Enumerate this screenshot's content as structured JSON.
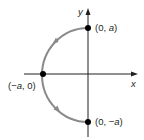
{
  "figure": {
    "type": "parametric-curve-diagram",
    "axes": {
      "x_label": "x",
      "y_label": "y"
    },
    "points": [
      {
        "id": "top",
        "label_text": "(0, a)",
        "label_pre": "(0, ",
        "label_var": "a",
        "label_post": ")"
      },
      {
        "id": "left",
        "label_text": "(−a, 0)",
        "label_pre": "(−",
        "label_var": "a",
        "label_post": ", 0)"
      },
      {
        "id": "bottom",
        "label_text": "(0, −a)",
        "label_pre": "(0, −",
        "label_var": "a",
        "label_post": ")"
      }
    ],
    "curve": {
      "shape": "semicircle",
      "side": "left",
      "start": "(0, a)",
      "through": "(−a, 0)",
      "end": "(0, −a)",
      "direction": "counterclockwise",
      "arrow_count": 2
    },
    "colors": {
      "axes": "#231f20",
      "curve": "#8a8a8a",
      "points": "#000000",
      "text": "#231f20"
    }
  }
}
